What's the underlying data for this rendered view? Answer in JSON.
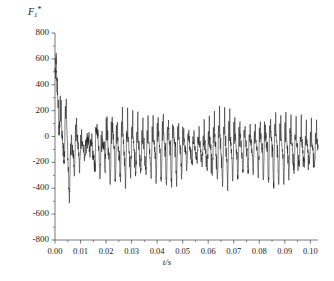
{
  "chart_data": {
    "type": "line",
    "title": "",
    "subtitle": "",
    "xlabel": "t/s",
    "ylabel": "F1*",
    "ylabel_base": "F",
    "ylabel_sub": "1",
    "ylabel_sup": "*",
    "xlim": [
      0.0,
      0.103
    ],
    "ylim": [
      -800,
      800
    ],
    "xticks": [
      0.0,
      0.01,
      0.02,
      0.03,
      0.04,
      0.05,
      0.06,
      0.07,
      0.08,
      0.09,
      0.1
    ],
    "xtick_labels": [
      "0.00",
      "0.01",
      "0.02",
      "0.03",
      "0.04",
      "0.05",
      "0.06",
      "0.07",
      "0.08",
      "0.09",
      "0.10"
    ],
    "yticks": [
      800,
      600,
      400,
      200,
      0,
      -200,
      -400,
      -600,
      -800
    ],
    "ytick_labels": [
      "800",
      "600",
      "400",
      "200",
      "0",
      "-200",
      "-400",
      "-600",
      "-800"
    ],
    "grid": false,
    "legend": null,
    "legend_position": "none",
    "axis_style": "open-left-bottom",
    "line_color": "#1c1c1c",
    "line_width": 0.55,
    "background_color": "#ffffff",
    "series": [
      {
        "name": "F1*",
        "mean_steady": -90,
        "envelope_upper_steady": 230,
        "envelope_lower_steady": -320,
        "transient_peak": 630,
        "transient_peak_time": 0.0031,
        "transient_min": -750,
        "transient_min_time": 0.0062,
        "fundamental_frequency_hz": 500,
        "sample_count": 2000,
        "annotations": []
      }
    ]
  },
  "figure": {
    "plot_left_px": 55,
    "plot_right_px": 318,
    "plot_top_px": 33,
    "plot_bottom_px": 240
  }
}
